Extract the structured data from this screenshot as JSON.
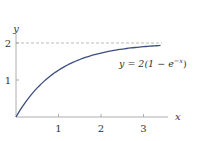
{
  "chart_data": {
    "type": "line",
    "title": "",
    "xlabel": "x",
    "ylabel": "y",
    "xlim": [
      0,
      3.5
    ],
    "ylim": [
      0,
      2.2
    ],
    "x_ticks": [
      "1",
      "2",
      "3"
    ],
    "y_ticks": [
      "1",
      "2"
    ],
    "grid": false,
    "series": [
      {
        "name": "y = 2(1 − e^{−x})",
        "x": [
          0,
          0.25,
          0.5,
          0.75,
          1,
          1.5,
          2,
          2.5,
          3,
          3.4
        ],
        "values": [
          0,
          0.44,
          0.79,
          1.06,
          1.26,
          1.55,
          1.73,
          1.84,
          1.9,
          1.93
        ],
        "color": "#3d4f80"
      }
    ],
    "annotations": [
      {
        "type": "hline",
        "y": 2,
        "style": "dashed",
        "color": "#aaaaaa"
      },
      {
        "type": "text",
        "text": "y = 2(1 − e^{−x})",
        "x": 2.7,
        "y": 1.55
      }
    ]
  },
  "labels": {
    "x_axis": "x",
    "y_axis": "y",
    "xt1": "1",
    "xt2": "2",
    "xt3": "3",
    "yt1": "1",
    "yt2": "2",
    "eq_lhs": "y = 2(1 − e",
    "eq_exp": "−x",
    "eq_rhs": ")"
  }
}
